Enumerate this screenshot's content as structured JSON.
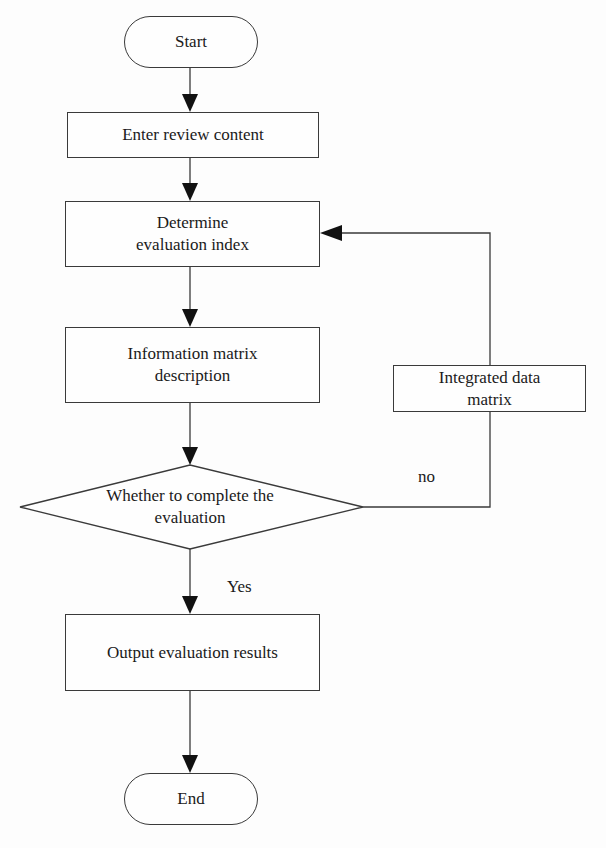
{
  "flowchart": {
    "start": "Start",
    "enter": "Enter review content",
    "determine": "Determine evaluation index",
    "info": "Information matrix description",
    "decision": "Whether to complete the evaluation",
    "integrated": "Integrated data matrix",
    "output": "Output evaluation results",
    "end": "End",
    "yes_label": "Yes",
    "no_label": "no"
  },
  "colors": {
    "stroke": "#3a3a3a",
    "arrow": "#111111",
    "background": "#fdfdfd"
  }
}
